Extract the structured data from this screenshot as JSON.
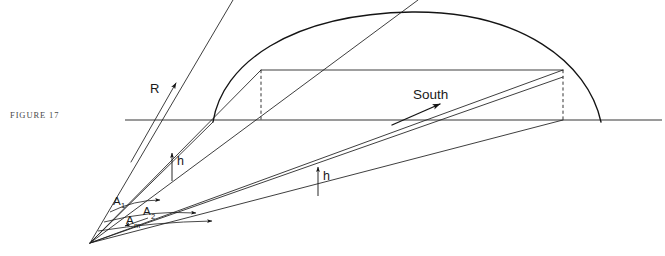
{
  "figure": {
    "caption": "FIGURE 17"
  },
  "labels": {
    "south": "South",
    "resultant": "R",
    "height_left": "h",
    "height_right": "h",
    "angle_1_base": "A",
    "angle_1_sub": "1",
    "angle_2_base": "A",
    "angle_2_sub": "2",
    "angle_m_base": "A",
    "angle_m_sub": "m"
  },
  "colors": {
    "ink": "#141414",
    "ink_soft": "#2a2a2a",
    "caption": "#4a4a4a",
    "background": "#ffffff"
  },
  "geometry": {
    "canvas": {
      "width": 665,
      "height": 256
    },
    "vertex": {
      "x": 90,
      "y": 243
    },
    "horizon": {
      "x1": 125,
      "y1": 120,
      "x2": 662,
      "y2": 120
    },
    "chord": {
      "x1": 261,
      "y1": 70,
      "x2": 563,
      "y2": 70
    },
    "dome": {
      "left_base": {
        "x": 213,
        "y": 122
      },
      "apex": {
        "x": 412,
        "y": 12
      },
      "right_base": {
        "x": 601,
        "y": 122
      }
    },
    "dashed_verticals": [
      {
        "x": 261,
        "y_top": 70,
        "y_bottom": 120
      },
      {
        "x": 563,
        "y_top": 70,
        "y_bottom": 120
      }
    ],
    "rays": [
      {
        "name": "ray-steep-outer",
        "x2": 233,
        "y2": 0
      },
      {
        "name": "ray-steep-inner",
        "x2": 261,
        "y2": 70
      },
      {
        "name": "ray-mid-upper",
        "x2": 418,
        "y2": 0
      },
      {
        "name": "ray-mid-lower",
        "x2": 213,
        "y2": 122
      },
      {
        "name": "ray-south-upper",
        "x2": 563,
        "y2": 70
      },
      {
        "name": "ray-south-lower",
        "x2": 563,
        "y2": 76
      },
      {
        "name": "ray-shallow",
        "x2": 563,
        "y2": 120
      }
    ],
    "height_markers": [
      {
        "name": "h-left",
        "x": 172,
        "y_top": 152,
        "y_bottom": 180
      },
      {
        "name": "h-right",
        "x": 318,
        "y_top": 166,
        "y_bottom": 196
      }
    ],
    "angle_arcs": [
      {
        "name": "A1",
        "label_x": 114,
        "label_y": 203
      },
      {
        "name": "A2",
        "label_x": 143,
        "label_y": 213
      },
      {
        "name": "Am",
        "label_x": 129,
        "label_y": 222
      }
    ],
    "resultant_vector": {
      "x1": 133,
      "y1": 158,
      "x2": 175,
      "y2": 84
    },
    "south_arrow": {
      "x1": 390,
      "y1": 124,
      "x2": 438,
      "y2": 104
    }
  }
}
